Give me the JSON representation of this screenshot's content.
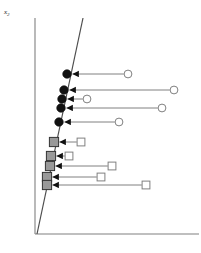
{
  "figure": {
    "title": "",
    "axis_labels": {
      "y": "x",
      "y_subscript": "2"
    },
    "colors": {
      "axis": "#808080",
      "boundary_line": "#4d4d4d",
      "filled_circle": "#111111",
      "open_circle_stroke": "#808080",
      "filled_square": "#999999",
      "filled_square_stroke": "#333333",
      "open_square_stroke": "#808080",
      "arrow": "#111111",
      "connector": "#808080",
      "background": "#ffffff"
    }
  },
  "chart_data": {
    "type": "scatter",
    "title": "",
    "xlabel": "",
    "ylabel": "x2",
    "grid": false,
    "legend": null,
    "axes": {
      "y_axis": {
        "x": 35,
        "y_top": 18,
        "y_bottom": 234
      },
      "x_axis": {
        "y": 234,
        "x_left": 35,
        "x_right": 199
      }
    },
    "boundary_line": {
      "label": "decision boundary",
      "x1": 83,
      "y1": 18,
      "x2": 37,
      "y2": 234
    },
    "series": [
      {
        "name": "class-circle",
        "marker": "circle",
        "projected_marker": "filled-circle",
        "origin_marker": "open-circle",
        "points": [
          {
            "origin_x": 128,
            "origin_y": 74,
            "target_x": 67,
            "target_y": 74
          },
          {
            "origin_x": 174,
            "origin_y": 90,
            "target_x": 64,
            "target_y": 90
          },
          {
            "origin_x": 87,
            "origin_y": 99,
            "target_x": 62,
            "target_y": 99
          },
          {
            "origin_x": 162,
            "origin_y": 108,
            "target_x": 61,
            "target_y": 108
          },
          {
            "origin_x": 119,
            "origin_y": 122,
            "target_x": 59,
            "target_y": 122
          }
        ]
      },
      {
        "name": "class-square",
        "marker": "square",
        "projected_marker": "filled-square",
        "origin_marker": "open-square",
        "points": [
          {
            "origin_x": 81,
            "origin_y": 142,
            "target_x": 54,
            "target_y": 142
          },
          {
            "origin_x": 69,
            "origin_y": 156,
            "target_x": 51,
            "target_y": 156
          },
          {
            "origin_x": 112,
            "origin_y": 166,
            "target_x": 50,
            "target_y": 166
          },
          {
            "origin_x": 101,
            "origin_y": 177,
            "target_x": 47,
            "target_y": 177
          },
          {
            "origin_x": 146,
            "origin_y": 185,
            "target_x": 47,
            "target_y": 185
          }
        ]
      }
    ]
  }
}
